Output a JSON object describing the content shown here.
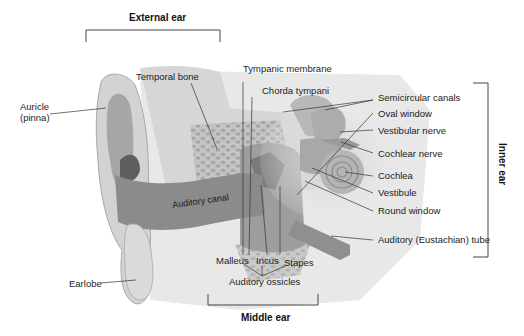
{
  "diagram": {
    "sections": {
      "external": "External ear",
      "middle": "Middle ear",
      "inner": "Inner ear"
    },
    "labels": {
      "auricle_line1": "Auricle",
      "auricle_line2": "(pinna)",
      "temporal_bone": "Temporal bone",
      "tympanic_membrane": "Tympanic membrane",
      "chorda_tympani": "Chorda tympani",
      "semicircular_canals": "Semicircular canals",
      "oval_window": "Oval window",
      "vestibular_nerve": "Vestibular nerve",
      "cochlear_nerve": "Cochlear nerve",
      "cochlea": "Cochlea",
      "vestibule": "Vestibule",
      "round_window": "Round window",
      "auditory_tube": "Auditory (Eustachian) tube",
      "auditory_canal": "Auditory canal",
      "earlobe": "Earlobe",
      "malleus": "Malleus",
      "incus": "Incus",
      "stapes": "Stapes",
      "auditory_ossicles": "Auditory ossicles"
    },
    "colors": {
      "background": "#ffffff",
      "skin_light": "#d9d9d9",
      "skin_mid": "#bdbdbd",
      "canal_dark": "#8a8a8a",
      "bone": "#c8c8c8",
      "leader_line": "#333333"
    }
  }
}
